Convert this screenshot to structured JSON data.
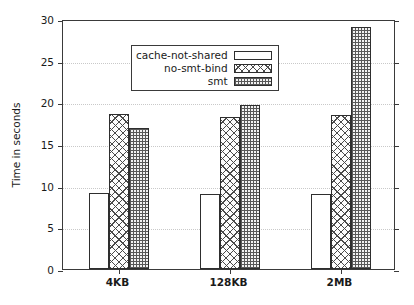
{
  "chart_data": {
    "type": "bar",
    "title": "",
    "xlabel": "",
    "ylabel": "Time in seconds",
    "categories": [
      "4KB",
      "128KB",
      "2MB"
    ],
    "series": [
      {
        "name": "cache-not-shared",
        "pattern": "empty",
        "values": [
          9.1,
          9.0,
          9.0
        ]
      },
      {
        "name": "no-smt-bind",
        "pattern": "crosshatch",
        "values": [
          18.6,
          18.3,
          18.5
        ]
      },
      {
        "name": "smt",
        "pattern": "checker",
        "values": [
          16.9,
          19.7,
          29.0
        ]
      }
    ],
    "ylim": [
      0,
      30
    ],
    "yticks": [
      0,
      5,
      10,
      15,
      20,
      25,
      30
    ],
    "ytick_labels": [
      "0",
      "5",
      "10",
      "15",
      "20",
      "25",
      "30"
    ],
    "grid": true,
    "grid_axis": "y",
    "legend_position": "upper-left",
    "colors": {
      "axis": "#3a3a3a",
      "grid": "#c9c9c9",
      "bar_outline": "#2e2e2e",
      "background": "#ffffff",
      "text": "#1a1a1a"
    }
  }
}
